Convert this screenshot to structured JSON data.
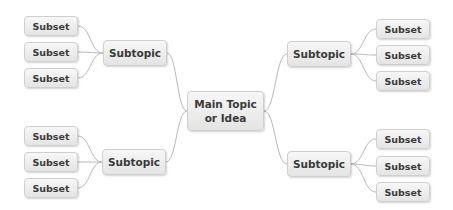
{
  "diagram": {
    "type": "mind-map",
    "colors": {
      "node_border": "#cfcfcf",
      "node_fill_top": "#f7f7f7",
      "node_fill_bottom": "#e4e4e4",
      "text": "#3a3a3a",
      "connector": "#b8b8b8"
    },
    "main_topic": {
      "label": "Main Topic\nor Idea"
    },
    "branches": [
      {
        "id": "top-left",
        "subtopic": "Subtopic",
        "subsets": [
          "Subset",
          "Subset",
          "Subset"
        ]
      },
      {
        "id": "top-right",
        "subtopic": "Subtopic",
        "subsets": [
          "Subset",
          "Subset",
          "Subset"
        ]
      },
      {
        "id": "bottom-left",
        "subtopic": "Subtopic",
        "subsets": [
          "Subset",
          "Subset",
          "Subset"
        ]
      },
      {
        "id": "bottom-right",
        "subtopic": "Subtopic",
        "subsets": [
          "Subset",
          "Subset",
          "Subset"
        ]
      }
    ]
  }
}
